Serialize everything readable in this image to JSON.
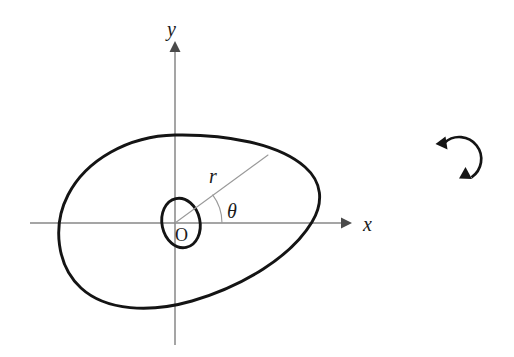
{
  "figure": {
    "background_color": "#ffffff",
    "width": 514,
    "height": 357,
    "curve_color": "#141414",
    "axis_color": "#878787",
    "ray_color": "#9a9a9a"
  },
  "axes": {
    "x_label": "x",
    "y_label": "y",
    "origin_label": "O",
    "origin": {
      "x": 175,
      "y": 223
    },
    "x_axis": {
      "start_x": 30,
      "end_x": 348,
      "y": 223
    },
    "y_axis": {
      "x": 175,
      "start_y": 45,
      "end_y": 345
    },
    "x_label_pos": {
      "x": 368,
      "y": 230
    },
    "y_label_pos": {
      "x": 173,
      "y": 32
    },
    "origin_label_pos": {
      "x": 182,
      "y": 240
    }
  },
  "annotations": {
    "radius_label": "r",
    "radius_label_pos": {
      "x": 213,
      "y": 180
    },
    "angle_label": "θ",
    "angle_label_pos": {
      "x": 231,
      "y": 215
    },
    "ray_end": {
      "x": 268,
      "y": 155
    },
    "angle_arc_radius": 47,
    "angle_degrees": 37
  },
  "shapes": {
    "outer_curve": {
      "name": "closed-convex-curve",
      "path": "M 175 135 C 128 136 86 160 68 195 C 52 226 57 266 81 288 C 106 311 150 313 192 301 C 243 286 291 257 312 222 C 324 202 322 182 305 167 C 279 144 227 134 175 135 Z",
      "leftmost_x": 62,
      "rightmost_x": 318,
      "topmost_y": 135,
      "bottommost_y": 307
    },
    "inner_oval": {
      "name": "small-inner-oval",
      "center": {
        "x": 181,
        "y": 223
      },
      "rx": 19,
      "ry": 25,
      "rotation_deg": -12
    },
    "rotation_arrow": {
      "name": "counterclockwise-rotation-symbol",
      "center": {
        "x": 458,
        "y": 160
      },
      "radius": 22,
      "direction": "counterclockwise"
    }
  }
}
